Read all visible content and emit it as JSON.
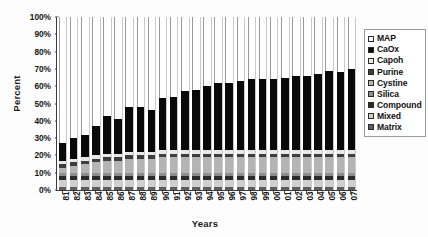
{
  "chart_data": {
    "type": "bar",
    "subtype": "100% stacked column",
    "title": "",
    "xlabel": "Years",
    "ylabel": "Percent",
    "ylim": [
      0,
      100
    ],
    "ytick_labels": [
      "0%",
      "10%",
      "20%",
      "30%",
      "40%",
      "50%",
      "60%",
      "70%",
      "80%",
      "90%",
      "100%"
    ],
    "ytick_values": [
      0,
      10,
      20,
      30,
      40,
      50,
      60,
      70,
      80,
      90,
      100
    ],
    "grid": false,
    "legend_position": "right",
    "categories": [
      "81",
      "82",
      "83",
      "84",
      "85",
      "86",
      "87",
      "88",
      "89",
      "90",
      "91",
      "92",
      "93",
      "94",
      "95",
      "96",
      "97",
      "98",
      "99",
      "00",
      "01",
      "02",
      "03",
      "04",
      "05",
      "06",
      "07"
    ],
    "series": [
      {
        "name": "Matrix",
        "color": "#5e5e5e",
        "values": [
          2,
          2,
          2,
          2,
          2,
          2,
          2,
          2,
          2,
          2,
          2,
          2,
          2,
          2,
          2,
          2,
          2,
          2,
          2,
          2,
          2,
          2,
          2,
          2,
          2,
          2,
          2
        ]
      },
      {
        "name": "Mixed",
        "color": "#cfcfcf",
        "values": [
          4,
          4,
          4,
          4,
          4,
          4,
          4,
          4,
          4,
          4,
          4,
          4,
          4,
          4,
          4,
          4,
          4,
          4,
          4,
          4,
          4,
          4,
          4,
          4,
          4,
          4,
          4
        ]
      },
      {
        "name": "Compound",
        "color": "#2b2b2b",
        "values": [
          2,
          2,
          2,
          2,
          2,
          2,
          2,
          2,
          2,
          2,
          2,
          2,
          2,
          2,
          2,
          2,
          2,
          2,
          2,
          2,
          2,
          2,
          2,
          2,
          2,
          2,
          2
        ]
      },
      {
        "name": "Silica",
        "color": "#8e8e8e",
        "values": [
          2,
          2,
          2,
          2,
          2,
          2,
          2,
          2,
          2,
          2,
          2,
          2,
          2,
          2,
          2,
          2,
          2,
          2,
          2,
          2,
          2,
          2,
          2,
          2,
          2,
          2,
          2
        ]
      },
      {
        "name": "Cystine",
        "color": "#b4b4b4",
        "values": [
          3,
          4,
          5,
          6,
          7,
          7,
          8,
          8,
          8,
          9,
          9,
          9,
          9,
          9,
          9,
          9,
          9,
          9,
          9,
          9,
          9,
          9,
          9,
          9,
          9,
          9,
          9
        ]
      },
      {
        "name": "Purine",
        "color": "#3d3d3d",
        "values": [
          2,
          2,
          2,
          2,
          2,
          2,
          2,
          2,
          2,
          2,
          2,
          2,
          2,
          2,
          2,
          2,
          2,
          2,
          2,
          2,
          2,
          2,
          2,
          2,
          2,
          2,
          2
        ]
      },
      {
        "name": "Capoh",
        "color": "#e8e8e8",
        "values": [
          2,
          2,
          2,
          2,
          2,
          2,
          2,
          2,
          2,
          2,
          2,
          2,
          2,
          2,
          2,
          2,
          2,
          2,
          2,
          2,
          2,
          2,
          2,
          2,
          2,
          2,
          2
        ]
      },
      {
        "name": "CaOx",
        "color": "#090909",
        "values": [
          10,
          12,
          13,
          17,
          22,
          20,
          26,
          26,
          24,
          30,
          31,
          34,
          35,
          37,
          39,
          39,
          40,
          41,
          41,
          41,
          42,
          43,
          43,
          44,
          46,
          45,
          47
        ]
      },
      {
        "name": "MAP",
        "color": "#fbfbfb",
        "values": [
          73,
          70,
          68,
          63,
          57,
          59,
          52,
          52,
          54,
          47,
          46,
          43,
          42,
          40,
          38,
          38,
          37,
          36,
          36,
          36,
          35,
          34,
          34,
          33,
          31,
          32,
          30
        ]
      }
    ]
  },
  "legend": {
    "items": [
      {
        "label": "MAP"
      },
      {
        "label": "CaOx"
      },
      {
        "label": "Capoh"
      },
      {
        "label": "Purine"
      },
      {
        "label": "Cystine"
      },
      {
        "label": "Silica"
      },
      {
        "label": "Compound"
      },
      {
        "label": "Mixed"
      },
      {
        "label": "Matrix"
      }
    ]
  }
}
